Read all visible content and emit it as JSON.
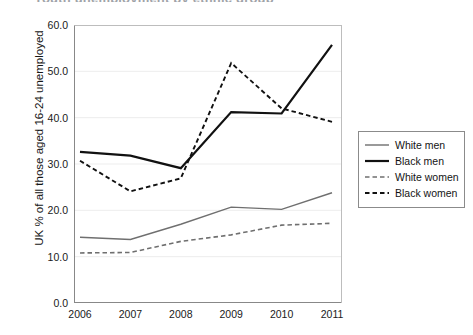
{
  "title_sliver": "Youth unemployment by ethnic group",
  "axes": {
    "ylabel": "UK % of all those aged 16-24 unemployed",
    "xlabel": "",
    "y_ticks": [
      "0.0",
      "10.0",
      "20.0",
      "30.0",
      "40.0",
      "50.0",
      "60.0"
    ],
    "x_ticks": [
      "2006",
      "2007",
      "2008",
      "2009",
      "2010",
      "2011"
    ]
  },
  "legend": {
    "items": [
      {
        "label": "White men",
        "style": "solid",
        "color": "#6f6f6f",
        "width": 1.4
      },
      {
        "label": "Black men",
        "style": "solid",
        "color": "#111111",
        "width": 2.2
      },
      {
        "label": "White women",
        "style": "dashed",
        "color": "#6f6f6f",
        "width": 1.6
      },
      {
        "label": "Black women",
        "style": "dashed",
        "color": "#111111",
        "width": 1.9
      }
    ]
  },
  "chart_data": {
    "type": "line",
    "title": "Youth unemployment by ethnic group",
    "xlabel": "",
    "ylabel": "UK % of all those aged 16-24 unemployed",
    "categories": [
      "2006",
      "2007",
      "2008",
      "2009",
      "2010",
      "2011"
    ],
    "x": [
      2006,
      2007,
      2008,
      2009,
      2010,
      2011
    ],
    "ylim": [
      0.0,
      60.0
    ],
    "ytick_step": 10.0,
    "grid": "horizontal",
    "legend_position": "right-outside",
    "series": [
      {
        "name": "White men",
        "style": "solid",
        "color": "#6f6f6f",
        "values": [
          14.2,
          13.7,
          17.0,
          20.7,
          20.2,
          23.8
        ]
      },
      {
        "name": "Black men",
        "style": "solid",
        "color": "#111111",
        "values": [
          32.6,
          31.8,
          29.1,
          41.2,
          40.9,
          55.7
        ]
      },
      {
        "name": "White women",
        "style": "dashed",
        "color": "#6f6f6f",
        "values": [
          10.8,
          10.9,
          13.3,
          14.7,
          16.8,
          17.2
        ]
      },
      {
        "name": "Black women",
        "style": "dashed",
        "color": "#111111",
        "values": [
          30.7,
          24.1,
          26.9,
          51.8,
          42.0,
          39.1
        ]
      }
    ]
  }
}
